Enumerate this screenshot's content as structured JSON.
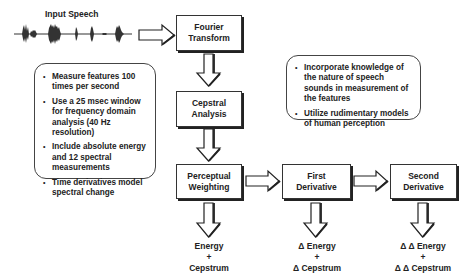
{
  "input": {
    "title": "Input Speech"
  },
  "blocks": [
    {
      "id": "fourier",
      "line1": "Fourier",
      "line2": "Transform"
    },
    {
      "id": "cepstral",
      "line1": "Cepstral",
      "line2": "Analysis"
    },
    {
      "id": "perceptual",
      "line1": "Perceptual",
      "line2": "Weighting"
    },
    {
      "id": "first",
      "line1": "First",
      "line2": "Derivative"
    },
    {
      "id": "second",
      "line1": "Second",
      "line2": "Derivative"
    }
  ],
  "notes": {
    "left": [
      "Measure features 100 times per second",
      "Use a 25 msec window for frequency domain analysis (40 Hz resolution)",
      "Include absolute energy and 12 spectral measurements",
      "Time derivatives model spectral change"
    ],
    "right": [
      "Incorporate knowledge of the nature of speech sounds in measurement of the features",
      "Utilize rudimentary models of human perception"
    ]
  },
  "outputs": [
    {
      "line1": "Energy",
      "plus": "+",
      "line3": "Cepstrum"
    },
    {
      "line1": "Δ Energy",
      "plus": "+",
      "line3": "Δ Cepstrum"
    },
    {
      "line1": "Δ Δ Energy",
      "plus": "+",
      "line3": "Δ Δ Cepstrum"
    }
  ]
}
